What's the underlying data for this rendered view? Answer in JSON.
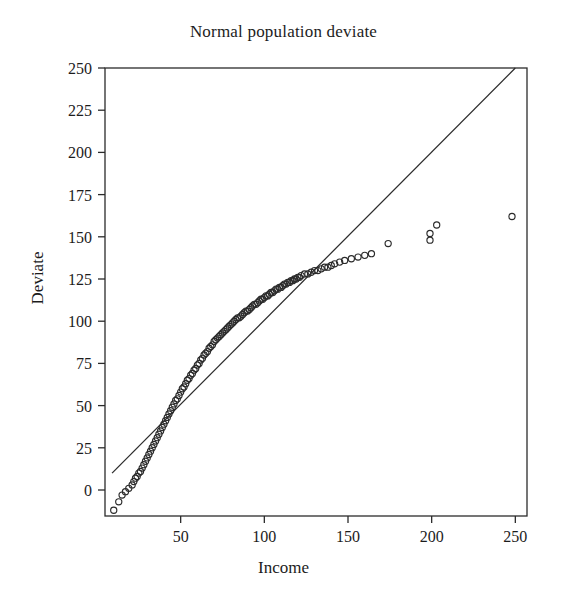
{
  "chart_data": {
    "type": "scatter",
    "title": "Normal population deviate",
    "subtitle": "",
    "xlabel": "Income",
    "ylabel": "Deviate",
    "xlim": [
      8,
      250
    ],
    "ylim": [
      -15,
      250
    ],
    "xticks": [
      50,
      100,
      150,
      200,
      250
    ],
    "yticks": [
      0,
      25,
      50,
      75,
      100,
      125,
      150,
      175,
      200,
      225,
      250
    ],
    "grid": false,
    "legend": null,
    "marker": "open-circle",
    "annotations": [],
    "series": [
      {
        "name": "Q-Q points",
        "marker": "open-circle",
        "x": [
          10,
          13,
          15,
          17,
          19,
          21,
          22,
          23,
          24,
          25,
          26,
          27,
          28,
          29,
          30,
          31,
          32,
          33,
          34,
          35,
          36,
          37,
          38,
          39,
          40,
          41,
          42,
          43,
          44,
          45,
          46,
          47,
          48,
          49,
          50,
          51,
          52,
          53,
          54,
          55,
          56,
          57,
          58,
          59,
          60,
          61,
          62,
          63,
          64,
          65,
          66,
          67,
          68,
          69,
          70,
          71,
          72,
          73,
          74,
          75,
          76,
          77,
          78,
          79,
          80,
          81,
          82,
          83,
          84,
          85,
          86,
          87,
          88,
          89,
          90,
          91,
          92,
          93,
          94,
          95,
          96,
          97,
          98,
          99,
          100,
          101,
          102,
          103,
          104,
          105,
          106,
          107,
          108,
          109,
          110,
          111,
          112,
          113,
          114,
          115,
          116,
          117,
          118,
          119,
          120,
          121,
          122,
          124,
          126,
          128,
          130,
          132,
          134,
          136,
          138,
          140,
          142,
          145,
          148,
          152,
          156,
          160,
          164,
          174,
          199,
          199,
          203,
          248
        ],
        "y": [
          -12,
          -7,
          -3,
          -1,
          1,
          3,
          5,
          7,
          8,
          10,
          11,
          13,
          15,
          17,
          19,
          21,
          23,
          25,
          27,
          29,
          31,
          33,
          35,
          37,
          39,
          41,
          43,
          45,
          47,
          49,
          51,
          53,
          54,
          56,
          58,
          60,
          61,
          63,
          65,
          66,
          68,
          69,
          71,
          72,
          74,
          75,
          77,
          78,
          80,
          81,
          82,
          84,
          85,
          86,
          88,
          89,
          90,
          91,
          92,
          93,
          94,
          95,
          96,
          97,
          98,
          99,
          100,
          101,
          102,
          102,
          103,
          104,
          105,
          106,
          106,
          107,
          108,
          109,
          110,
          110,
          111,
          112,
          113,
          113,
          114,
          115,
          115,
          116,
          117,
          117,
          118,
          119,
          119,
          120,
          120,
          121,
          122,
          122,
          123,
          123,
          124,
          124,
          125,
          125,
          126,
          126,
          127,
          128,
          128,
          129,
          130,
          130,
          131,
          132,
          132,
          133,
          134,
          135,
          136,
          137,
          138,
          139,
          140,
          146,
          148,
          152,
          157,
          162
        ]
      }
    ],
    "reference_line": {
      "name": "normal reference line",
      "x": [
        9,
        250
      ],
      "y": [
        10,
        250
      ]
    }
  }
}
